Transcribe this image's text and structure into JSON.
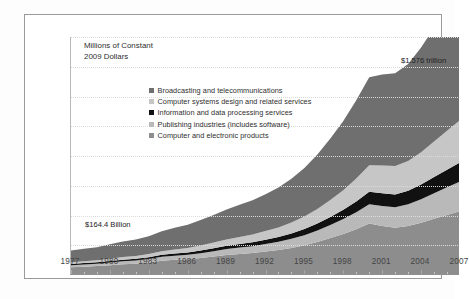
{
  "chart_data": {
    "type": "area",
    "title": "",
    "subtitle": "",
    "axis_title": "Millions of Constant\n2009 Dollars",
    "xlabel": "",
    "ylabel": "Millions of Constant 2009 Dollars",
    "stacked": true,
    "grid": true,
    "legend_position": "inside-upper-left",
    "xlim": [
      1977,
      2007
    ],
    "ylim": [
      0,
      1600
    ],
    "ytick_values": [
      0,
      200,
      400,
      600,
      800,
      1000,
      1200,
      1400,
      1600
    ],
    "ytick_labels": [
      "0",
      "200",
      "400",
      "600",
      "800",
      "1000",
      "1200",
      "1400",
      "1600"
    ],
    "xtick_values": [
      1977,
      1980,
      1983,
      1986,
      1989,
      1992,
      1995,
      1998,
      2001,
      2004,
      2007
    ],
    "xtick_labels": [
      "1977",
      "1980",
      "1983",
      "1986",
      "1989",
      "1992",
      "1995",
      "1998",
      "2001",
      "2004",
      "2007"
    ],
    "x": [
      1977,
      1978,
      1979,
      1980,
      1981,
      1982,
      1983,
      1984,
      1985,
      1986,
      1987,
      1988,
      1989,
      1990,
      1991,
      1992,
      1993,
      1994,
      1995,
      1996,
      1997,
      1998,
      1999,
      2000,
      2001,
      2002,
      2003,
      2004,
      2005,
      2006,
      2007
    ],
    "stack_order_bottom_to_top": [
      "Computer and electronic products",
      "Publishing industries (includes software)",
      "Information and data processing services",
      "Computer systems design and related services",
      "Broadcasting and telecommunications"
    ],
    "series": [
      {
        "name": "Computer and electronic products",
        "color": "#8d8d8d",
        "values": [
          52,
          56,
          60,
          66,
          72,
          76,
          84,
          96,
          102,
          106,
          114,
          124,
          134,
          142,
          148,
          158,
          168,
          182,
          200,
          222,
          248,
          276,
          308,
          346,
          330,
          318,
          330,
          352,
          378,
          404,
          428
        ]
      },
      {
        "name": "Publishing industries (includes software)",
        "color": "#b9b9b9",
        "values": [
          14,
          15,
          16,
          18,
          20,
          21,
          23,
          26,
          28,
          30,
          33,
          36,
          40,
          43,
          46,
          50,
          55,
          61,
          68,
          77,
          88,
          100,
          114,
          130,
          134,
          138,
          146,
          158,
          172,
          186,
          200
        ]
      },
      {
        "name": "Information and data processing services",
        "color": "#111111",
        "values": [
          8,
          9,
          9,
          10,
          11,
          12,
          13,
          14,
          15,
          16,
          18,
          20,
          22,
          24,
          26,
          29,
          32,
          36,
          41,
          47,
          54,
          62,
          72,
          84,
          86,
          86,
          90,
          98,
          108,
          118,
          128
        ]
      },
      {
        "name": "Computer systems design and related services",
        "color": "#c6c6c6",
        "values": [
          12,
          13,
          14,
          16,
          18,
          19,
          21,
          24,
          27,
          30,
          34,
          38,
          43,
          47,
          52,
          58,
          65,
          74,
          85,
          98,
          114,
          132,
          154,
          178,
          186,
          190,
          200,
          218,
          240,
          262,
          284
        ]
      },
      {
        "name": "Broadcasting and telecommunications",
        "color": "#6f6f6f",
        "values": [
          78,
          83,
          88,
          96,
          104,
          110,
          120,
          134,
          146,
          156,
          170,
          186,
          202,
          216,
          230,
          248,
          268,
          294,
          326,
          366,
          414,
          466,
          526,
          592,
          612,
          624,
          652,
          704,
          764,
          824,
          884
        ]
      }
    ],
    "totals": {
      "1977": 164.4,
      "2007": 1576
    },
    "annotations": [
      {
        "name": "start-total",
        "text": "$164.4 Billion",
        "x": 1977,
        "y": 205
      },
      {
        "name": "end-total",
        "text": "$1.576 trillion",
        "x": 2007,
        "y": 1420
      }
    ]
  },
  "legend": {
    "items": [
      {
        "label": "Broadcasting and telecommunications",
        "color": "#6f6f6f"
      },
      {
        "label": "Computer systems design and related services",
        "color": "#c6c6c6"
      },
      {
        "label": "Information and data processing services",
        "color": "#111111"
      },
      {
        "label": "Publishing industries (includes software)",
        "color": "#b9b9b9"
      },
      {
        "label": "Computer and electronic products",
        "color": "#8d8d8d"
      }
    ]
  },
  "caption": {
    "text": ""
  },
  "colors": {
    "frame": "#9a9a9a",
    "grid": "#dcdcdc",
    "axis": "#8f8f8f",
    "text": "#3b3b3b",
    "background": "#ffffff"
  }
}
